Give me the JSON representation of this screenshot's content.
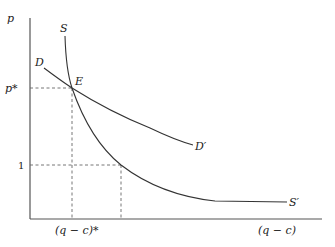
{
  "diagram": {
    "axes": {
      "y_label": "p",
      "x_label": "(q − c)"
    },
    "ticks": {
      "y_equilibrium": "p*",
      "y_one": "1",
      "x_equilibrium": "(q − c)*"
    },
    "curves": {
      "demand": {
        "start_label": "D",
        "end_label": "D′"
      },
      "supply": {
        "start_label": "S",
        "end_label": "S′"
      }
    },
    "points": {
      "equilibrium": "E"
    }
  }
}
